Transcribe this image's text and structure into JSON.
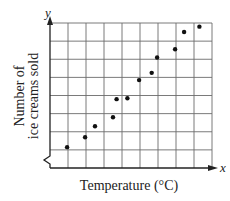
{
  "chart_data": {
    "type": "scatter",
    "title": "",
    "xlabel": "Temperature (°C)",
    "ylabel": [
      "Number of",
      "ice creams sold"
    ],
    "x_axis_var": "x",
    "y_axis_var": "y",
    "grid": true,
    "grid_cols": 9,
    "grid_rows": 8,
    "y_axis_break": true,
    "xlim": [
      0,
      9
    ],
    "ylim": [
      0,
      8
    ],
    "tick_labels": "none",
    "points": [
      {
        "x": 0.95,
        "y": 1.15
      },
      {
        "x": 1.95,
        "y": 1.7
      },
      {
        "x": 2.5,
        "y": 2.3
      },
      {
        "x": 3.5,
        "y": 2.8
      },
      {
        "x": 3.7,
        "y": 3.8
      },
      {
        "x": 4.3,
        "y": 3.85
      },
      {
        "x": 4.95,
        "y": 4.85
      },
      {
        "x": 5.65,
        "y": 5.25
      },
      {
        "x": 5.95,
        "y": 6.1
      },
      {
        "x": 6.95,
        "y": 6.55
      },
      {
        "x": 7.45,
        "y": 7.5
      },
      {
        "x": 8.3,
        "y": 7.8
      }
    ],
    "colors": {
      "points": "#111111",
      "grid": "#6b6b6b",
      "axes": "#222222"
    }
  }
}
